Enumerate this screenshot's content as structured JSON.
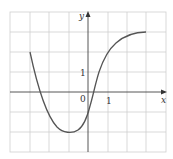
{
  "figure": {
    "axes": {
      "x_label": "x",
      "y_label": "y",
      "origin_label": "0",
      "x_tick_label": "1",
      "y_tick_label": "1"
    },
    "grid": {
      "columns": 8,
      "rows": 7,
      "x_range": [
        -4,
        4
      ],
      "y_range": [
        -3,
        4
      ]
    },
    "curve": {
      "description": "Decreases from (-3, 2) to a minimum near (-1, -2), rises through (0, -1), crosses x-axis near 0.3, levels off approaching y = 3 near x = 3",
      "points": [
        [
          -3,
          2
        ],
        [
          -2,
          -0.5
        ],
        [
          -1,
          -2
        ],
        [
          0,
          -1
        ],
        [
          0.3,
          0
        ],
        [
          1,
          2
        ],
        [
          2,
          2.8
        ],
        [
          3,
          3
        ]
      ]
    },
    "colors": {
      "grid": "#cccccc",
      "axis": "#444444",
      "curve": "#555555"
    }
  }
}
